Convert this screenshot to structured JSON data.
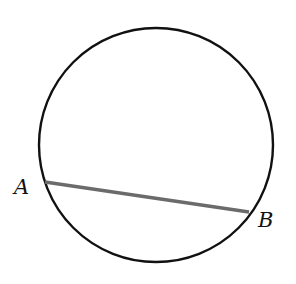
{
  "diagram": {
    "type": "circle-with-chord",
    "circle": {
      "cx": 156,
      "cy": 145,
      "r": 117,
      "stroke": "#111111",
      "stroke_width": 2.4
    },
    "chord": {
      "x1": 45,
      "y1": 182,
      "x2": 249,
      "y2": 212,
      "stroke": "#6b6b6b",
      "stroke_width": 3.4
    },
    "points": [
      {
        "name": "A",
        "label": "A",
        "label_x": 14,
        "label_y": 194
      },
      {
        "name": "B",
        "label": "B",
        "label_x": 258,
        "label_y": 227
      }
    ]
  }
}
